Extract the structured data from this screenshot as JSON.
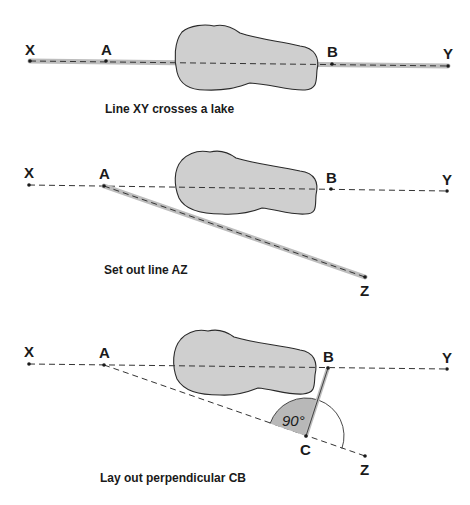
{
  "figure": {
    "panels": [
      {
        "caption": "Line XY crosses a lake",
        "points": {
          "X": "X",
          "A": "A",
          "B": "B",
          "Y": "Y"
        }
      },
      {
        "caption": "Set out line AZ",
        "points": {
          "X": "X",
          "A": "A",
          "B": "B",
          "Y": "Y",
          "Z": "Z"
        }
      },
      {
        "caption": "Lay out perpendicular CB",
        "points": {
          "X": "X",
          "A": "A",
          "B": "B",
          "Y": "Y",
          "C": "C",
          "Z": "Z"
        },
        "angle_label": "90°"
      }
    ],
    "colors": {
      "lake_fill": "#cfcfcf",
      "highlight_band": "#bdbdbd",
      "ink": "#1a1a1a"
    }
  }
}
